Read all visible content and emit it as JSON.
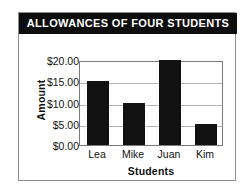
{
  "card": {
    "title": "ALLOWANCES OF FOUR STUDENTS",
    "border_color": "#8d8d8d",
    "title_bar_color": "#0d0d0d",
    "title_text_color": "#ffffff"
  },
  "chart_data": {
    "type": "bar",
    "title": "ALLOWANCES OF FOUR STUDENTS",
    "categories": [
      "Lea",
      "Mike",
      "Juan",
      "Kim"
    ],
    "values": [
      15.0,
      10.0,
      20.0,
      5.0
    ],
    "xlabel": "Students",
    "ylabel": "Amount",
    "ylim": [
      0,
      20
    ],
    "ytick_values": [
      20,
      15,
      10,
      5,
      0
    ],
    "ytick_labels": [
      "$20.00",
      "$15.00",
      "$10.00",
      "$5.00",
      "$0.00"
    ],
    "grid": true,
    "grid_color": "#b4b4b4",
    "legend": "none",
    "bar_color": "#111111",
    "plot_background": "#ffffff",
    "axis_color": "#7a7a7a"
  }
}
